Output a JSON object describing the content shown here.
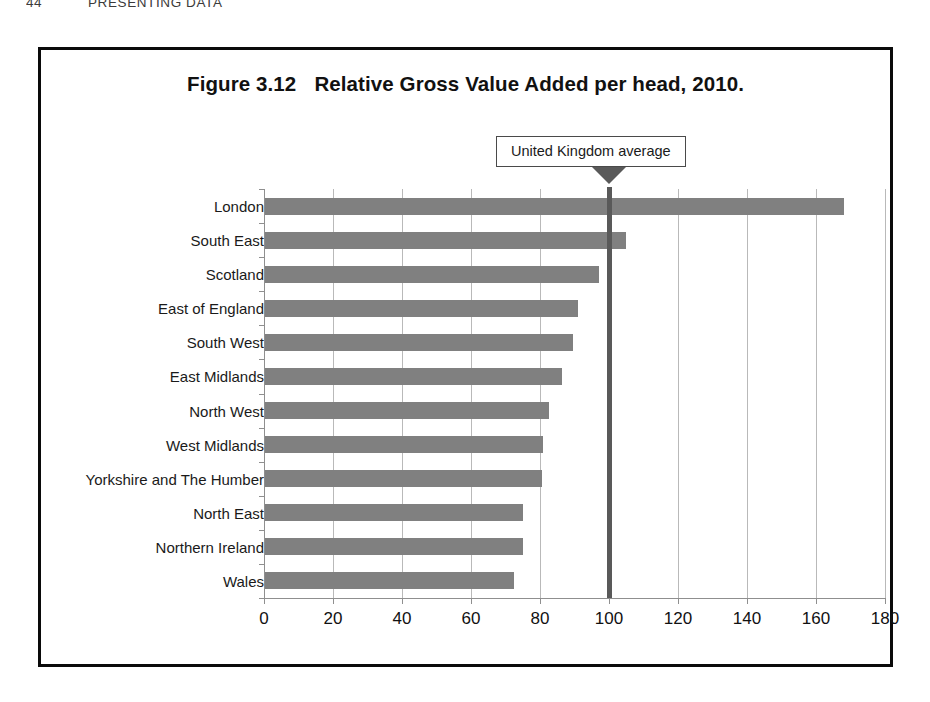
{
  "running_head": {
    "folio": "44",
    "title": "PRESENTING DATA"
  },
  "figure": {
    "number": "Figure 3.12",
    "title": "Relative Gross Value Added per head, 2010.",
    "annotation_label": "United Kingdom average"
  },
  "colors": {
    "bar": "#808080",
    "average_line": "#595959",
    "gridline": "#b9b9b9",
    "frame": "#0a0a0a"
  },
  "chart_data": {
    "type": "bar",
    "orientation": "horizontal",
    "xlabel": "",
    "ylabel": "",
    "xlim": [
      0,
      180
    ],
    "xticks": [
      0,
      20,
      40,
      60,
      80,
      100,
      120,
      140,
      160,
      180
    ],
    "xtick_labels": [
      "0",
      "20",
      "40",
      "60",
      "80",
      "100",
      "120",
      "140",
      "160",
      "180"
    ],
    "grid": true,
    "legend": false,
    "categories": [
      "London",
      "South East",
      "Scotland",
      "East of England",
      "South West",
      "East Midlands",
      "North West",
      "West Midlands",
      "Yorkshire and The Humber",
      "North East",
      "Northern Ireland",
      "Wales"
    ],
    "values": [
      168,
      105,
      97,
      91,
      89.5,
      86.5,
      82.5,
      81,
      80.5,
      75,
      75,
      72.5
    ],
    "annotations": [
      {
        "label": "United Kingdom average",
        "value": 100,
        "type": "reference-line"
      }
    ]
  }
}
